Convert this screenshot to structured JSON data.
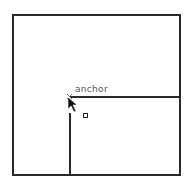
{
  "canvas": {
    "anchor_label": "anchor",
    "stroke_color": "#2a2a2a",
    "label_color": "#555555"
  },
  "cursor": {
    "type": "arrow-pointer-with-square"
  }
}
